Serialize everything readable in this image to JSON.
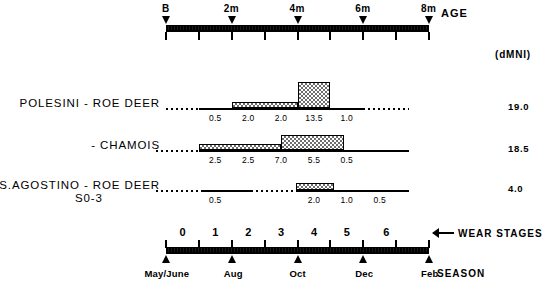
{
  "figure": {
    "top_axis": {
      "caption": "AGE",
      "ticks": [
        {
          "label": "B",
          "value": 0
        },
        {
          "label": "2m",
          "value": 2
        },
        {
          "label": "4m",
          "value": 4
        },
        {
          "label": "6m",
          "value": 6
        },
        {
          "label": "8m",
          "value": 8
        }
      ],
      "minor_tick_count": 8
    },
    "unit_header": "(dMNI)",
    "bottom_axis": {
      "caption_stages": "WEAR STAGES",
      "caption_season": "SEASON",
      "stage_numbers": [
        "0",
        "1",
        "2",
        "3",
        "4",
        "5",
        "6"
      ],
      "season_labels": [
        {
          "label": "May/June",
          "segment": 0
        },
        {
          "label": "Aug",
          "segment": 2
        },
        {
          "label": "Oct",
          "segment": 4
        },
        {
          "label": "Dec",
          "segment": 6
        },
        {
          "label": "Feb",
          "segment": 8
        }
      ]
    },
    "rows": [
      {
        "name": "POLESINI - ROE DEER",
        "sub": "",
        "dmni": "19.0",
        "values": [
          "0.5",
          "2.0",
          "2.0",
          "13.5",
          "1.0"
        ],
        "value_segments": [
          1,
          2,
          3,
          4,
          5
        ],
        "bars": [
          {
            "start_seg": 2,
            "end_seg": 4,
            "height": 6
          },
          {
            "start_seg": 4,
            "end_seg": 5,
            "height": 26
          }
        ],
        "segments": [
          {
            "start_seg": 0,
            "end_seg": 1,
            "style": "dotted"
          },
          {
            "start_seg": 1,
            "end_seg": 6,
            "style": "solid"
          },
          {
            "start_seg": 6,
            "end_seg": 7.4,
            "style": "dotted"
          }
        ]
      },
      {
        "name": "- CHAMOIS",
        "sub": "",
        "dmni": "18.5",
        "values": [
          "2.5",
          "2.5",
          "7.0",
          "5.5",
          "0.5"
        ],
        "value_segments": [
          1,
          2,
          3,
          4,
          5
        ],
        "bars": [
          {
            "start_seg": 1,
            "end_seg": 3.5,
            "height": 6
          },
          {
            "start_seg": 3.5,
            "end_seg": 5.4,
            "height": 15
          }
        ],
        "segments": [
          {
            "start_seg": -0.3,
            "end_seg": 1,
            "style": "dotted"
          },
          {
            "start_seg": 1,
            "end_seg": 7.4,
            "style": "solid"
          }
        ]
      },
      {
        "name": "S.AGOSTINO - ROE DEER",
        "sub": "S0-3",
        "dmni": "4.0",
        "values": [
          "0.5",
          "2.0",
          "1.0",
          "0.5"
        ],
        "value_segments": [
          1,
          4,
          5,
          6
        ],
        "bars": [
          {
            "start_seg": 3.95,
            "end_seg": 5.1,
            "height": 7
          }
        ],
        "segments": [
          {
            "start_seg": -0.3,
            "end_seg": 1.1,
            "style": "dotted"
          },
          {
            "start_seg": 1.1,
            "end_seg": 2.6,
            "style": "solid"
          },
          {
            "start_seg": 2.6,
            "end_seg": 3.95,
            "style": "dotted"
          },
          {
            "start_seg": 3.95,
            "end_seg": 7.4,
            "style": "solid"
          }
        ]
      }
    ]
  },
  "chart_data": {
    "type": "bar",
    "title": "",
    "xlabel": "AGE / WEAR STAGES / SEASON",
    "ylabel": "dMNI",
    "grid": false,
    "legend": "none",
    "x_age_ticks": [
      "B",
      "2m",
      "4m",
      "6m",
      "8m"
    ],
    "x_wear_stages": [
      "0",
      "1",
      "2",
      "3",
      "4",
      "5",
      "6"
    ],
    "x_season_ticks": [
      "May/June",
      "Aug",
      "Oct",
      "Dec",
      "Feb"
    ],
    "series": [
      {
        "name": "POLESINI - ROE DEER",
        "total_dmni": 19.0,
        "categories": [
          "0.5",
          "2.0",
          "2.0",
          "13.5",
          "1.0"
        ],
        "values": [
          0.5,
          2.0,
          2.0,
          13.5,
          1.0
        ]
      },
      {
        "name": "POLESINI - CHAMOIS",
        "total_dmni": 18.5,
        "categories": [
          "2.5",
          "2.5",
          "7.0",
          "5.5",
          "0.5"
        ],
        "values": [
          2.5,
          2.5,
          7.0,
          5.5,
          0.5
        ]
      },
      {
        "name": "S.AGOSTINO - ROE DEER S0-3",
        "total_dmni": 4.0,
        "categories": [
          "0.5",
          "2.0",
          "1.0",
          "0.5"
        ],
        "values": [
          0.5,
          2.0,
          1.0,
          0.5
        ]
      }
    ]
  }
}
